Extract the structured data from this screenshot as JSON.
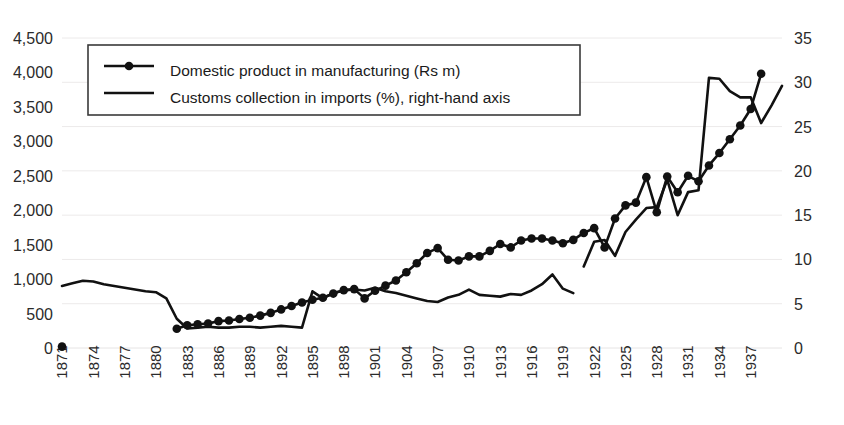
{
  "chart_data": {
    "type": "line",
    "title": "",
    "subtitle": "",
    "xlabel": "",
    "ylabel": "",
    "grid": true,
    "legend_position": "top-left",
    "x": [
      1871,
      1872,
      1873,
      1874,
      1875,
      1876,
      1877,
      1878,
      1879,
      1880,
      1881,
      1882,
      1883,
      1884,
      1885,
      1886,
      1887,
      1888,
      1889,
      1890,
      1891,
      1892,
      1893,
      1894,
      1895,
      1896,
      1897,
      1898,
      1899,
      1900,
      1901,
      1902,
      1903,
      1904,
      1905,
      1906,
      1907,
      1908,
      1909,
      1910,
      1911,
      1912,
      1913,
      1914,
      1915,
      1916,
      1917,
      1918,
      1919,
      1920,
      1921,
      1922,
      1923,
      1924,
      1925,
      1926,
      1927,
      1928,
      1929,
      1930,
      1931,
      1932,
      1933,
      1934,
      1935,
      1936,
      1937,
      1938
    ],
    "xtick_labels": [
      "1871",
      "1874",
      "1877",
      "1880",
      "1883",
      "1886",
      "1889",
      "1892",
      "1895",
      "1898",
      "1901",
      "1904",
      "1907",
      "1910",
      "1913",
      "1916",
      "1919",
      "1922",
      "1925",
      "1928",
      "1931",
      "1934",
      "1937"
    ],
    "xtick_step_years": 3,
    "axes": {
      "left": {
        "label": "Domestic product in manufacturing (Rs m)",
        "ylim": [
          0,
          4500
        ],
        "ticks": [
          0,
          500,
          1000,
          1500,
          2000,
          2500,
          3000,
          3500,
          4000,
          4500
        ],
        "tick_labels": [
          "0",
          "500",
          "1,000",
          "1,500",
          "2,000",
          "2,500",
          "3,000",
          "3,500",
          "4,000",
          "4,500"
        ]
      },
      "right": {
        "label": "Customs collection in imports (%)",
        "ylim": [
          0,
          35
        ],
        "ticks": [
          0,
          5,
          10,
          15,
          20,
          25,
          30,
          35
        ],
        "tick_labels": [
          "0",
          "5",
          "10",
          "15",
          "20",
          "25",
          "30",
          "35"
        ]
      }
    },
    "series": [
      {
        "name": "Domestic product in manufacturing (Rs m)",
        "axis": "left",
        "unit": "Rs m",
        "style": "line-with-markers",
        "color": "#111111",
        "points": [
          {
            "x": 1871,
            "y": 20
          },
          {
            "x": 1882,
            "y": 280
          },
          {
            "x": 1883,
            "y": 330
          },
          {
            "x": 1884,
            "y": 345
          },
          {
            "x": 1885,
            "y": 355
          },
          {
            "x": 1886,
            "y": 390
          },
          {
            "x": 1887,
            "y": 400
          },
          {
            "x": 1888,
            "y": 420
          },
          {
            "x": 1889,
            "y": 440
          },
          {
            "x": 1890,
            "y": 470
          },
          {
            "x": 1891,
            "y": 510
          },
          {
            "x": 1892,
            "y": 560
          },
          {
            "x": 1893,
            "y": 610
          },
          {
            "x": 1894,
            "y": 660
          },
          {
            "x": 1895,
            "y": 700
          },
          {
            "x": 1896,
            "y": 730
          },
          {
            "x": 1897,
            "y": 790
          },
          {
            "x": 1898,
            "y": 840
          },
          {
            "x": 1899,
            "y": 855
          },
          {
            "x": 1900,
            "y": 720
          },
          {
            "x": 1901,
            "y": 830
          },
          {
            "x": 1902,
            "y": 905
          },
          {
            "x": 1903,
            "y": 980
          },
          {
            "x": 1904,
            "y": 1100
          },
          {
            "x": 1905,
            "y": 1230
          },
          {
            "x": 1906,
            "y": 1380
          },
          {
            "x": 1907,
            "y": 1450
          },
          {
            "x": 1908,
            "y": 1280
          },
          {
            "x": 1909,
            "y": 1270
          },
          {
            "x": 1910,
            "y": 1330
          },
          {
            "x": 1911,
            "y": 1330
          },
          {
            "x": 1912,
            "y": 1410
          },
          {
            "x": 1913,
            "y": 1510
          },
          {
            "x": 1914,
            "y": 1460
          },
          {
            "x": 1915,
            "y": 1560
          },
          {
            "x": 1916,
            "y": 1590
          },
          {
            "x": 1917,
            "y": 1590
          },
          {
            "x": 1918,
            "y": 1560
          },
          {
            "x": 1919,
            "y": 1520
          },
          {
            "x": 1920,
            "y": 1570
          },
          {
            "x": 1921,
            "y": 1670
          },
          {
            "x": 1922,
            "y": 1740
          },
          {
            "x": 1923,
            "y": 1460
          },
          {
            "x": 1924,
            "y": 1880
          },
          {
            "x": 1925,
            "y": 2070
          },
          {
            "x": 1926,
            "y": 2110
          },
          {
            "x": 1927,
            "y": 2480
          },
          {
            "x": 1928,
            "y": 1970
          },
          {
            "x": 1929,
            "y": 2490
          },
          {
            "x": 1930,
            "y": 2260
          },
          {
            "x": 1931,
            "y": 2500
          },
          {
            "x": 1932,
            "y": 2420
          },
          {
            "x": 1933,
            "y": 2650
          },
          {
            "x": 1934,
            "y": 2830
          },
          {
            "x": 1935,
            "y": 3030
          },
          {
            "x": 1936,
            "y": 3230
          },
          {
            "x": 1937,
            "y": 3470
          },
          {
            "x": 1938,
            "y": 3980
          }
        ]
      },
      {
        "name": "Customs collection in imports (%), right-hand axis",
        "axis": "right",
        "unit": "%",
        "style": "line",
        "color": "#111111",
        "segments": [
          {
            "points": [
              {
                "x": 1871,
                "y": 7.0
              },
              {
                "x": 1872,
                "y": 7.3
              },
              {
                "x": 1873,
                "y": 7.6
              },
              {
                "x": 1874,
                "y": 7.5
              },
              {
                "x": 1875,
                "y": 7.2
              },
              {
                "x": 1876,
                "y": 7.0
              },
              {
                "x": 1877,
                "y": 6.8
              },
              {
                "x": 1878,
                "y": 6.6
              },
              {
                "x": 1879,
                "y": 6.4
              },
              {
                "x": 1880,
                "y": 6.3
              },
              {
                "x": 1881,
                "y": 5.6
              },
              {
                "x": 1882,
                "y": 3.3
              },
              {
                "x": 1883,
                "y": 2.2
              },
              {
                "x": 1884,
                "y": 2.3
              },
              {
                "x": 1885,
                "y": 2.4
              },
              {
                "x": 1886,
                "y": 2.3
              },
              {
                "x": 1887,
                "y": 2.3
              },
              {
                "x": 1888,
                "y": 2.4
              },
              {
                "x": 1889,
                "y": 2.4
              },
              {
                "x": 1890,
                "y": 2.3
              },
              {
                "x": 1891,
                "y": 2.4
              },
              {
                "x": 1892,
                "y": 2.5
              },
              {
                "x": 1893,
                "y": 2.4
              },
              {
                "x": 1894,
                "y": 2.3
              },
              {
                "x": 1895,
                "y": 6.4
              },
              {
                "x": 1896,
                "y": 5.6
              },
              {
                "x": 1897,
                "y": 6.2
              },
              {
                "x": 1898,
                "y": 6.5
              },
              {
                "x": 1899,
                "y": 6.6
              },
              {
                "x": 1900,
                "y": 6.5
              },
              {
                "x": 1901,
                "y": 6.8
              },
              {
                "x": 1902,
                "y": 6.4
              },
              {
                "x": 1903,
                "y": 6.2
              },
              {
                "x": 1904,
                "y": 5.9
              },
              {
                "x": 1905,
                "y": 5.6
              },
              {
                "x": 1906,
                "y": 5.3
              },
              {
                "x": 1907,
                "y": 5.2
              },
              {
                "x": 1908,
                "y": 5.7
              },
              {
                "x": 1909,
                "y": 6.0
              },
              {
                "x": 1910,
                "y": 6.6
              },
              {
                "x": 1911,
                "y": 6.0
              },
              {
                "x": 1912,
                "y": 5.9
              },
              {
                "x": 1913,
                "y": 5.8
              },
              {
                "x": 1914,
                "y": 6.1
              },
              {
                "x": 1915,
                "y": 6.0
              },
              {
                "x": 1916,
                "y": 6.5
              },
              {
                "x": 1917,
                "y": 7.2
              },
              {
                "x": 1918,
                "y": 8.3
              },
              {
                "x": 1919,
                "y": 6.7
              },
              {
                "x": 1920,
                "y": 6.2
              }
            ]
          },
          {
            "points": [
              {
                "x": 1921,
                "y": 9.2
              },
              {
                "x": 1922,
                "y": 12.0
              },
              {
                "x": 1923,
                "y": 12.2
              },
              {
                "x": 1924,
                "y": 10.4
              },
              {
                "x": 1925,
                "y": 13.1
              },
              {
                "x": 1926,
                "y": 14.5
              },
              {
                "x": 1927,
                "y": 15.8
              },
              {
                "x": 1928,
                "y": 15.9
              },
              {
                "x": 1929,
                "y": 19.0
              },
              {
                "x": 1930,
                "y": 15.0
              },
              {
                "x": 1931,
                "y": 17.6
              },
              {
                "x": 1932,
                "y": 17.8
              },
              {
                "x": 1933,
                "y": 30.5
              },
              {
                "x": 1934,
                "y": 30.4
              },
              {
                "x": 1935,
                "y": 29.0
              },
              {
                "x": 1936,
                "y": 28.3
              },
              {
                "x": 1937,
                "y": 28.3
              },
              {
                "x": 1938,
                "y": 25.4
              },
              {
                "x": 1939,
                "y": 27.4
              },
              {
                "x": 1940,
                "y": 29.6
              }
            ]
          }
        ]
      }
    ],
    "legend": [
      {
        "label": "Domestic product in manufacturing (Rs m)",
        "marker": "line-dot",
        "color": "#111111"
      },
      {
        "label": "Customs collection in imports (%), right-hand axis",
        "marker": "line",
        "color": "#111111"
      }
    ]
  },
  "colors": {
    "series": "#111111",
    "grid": "#eceaea",
    "text": "#2b2b2b",
    "legend_border": "#3a3a3a",
    "background": "#ffffff"
  }
}
